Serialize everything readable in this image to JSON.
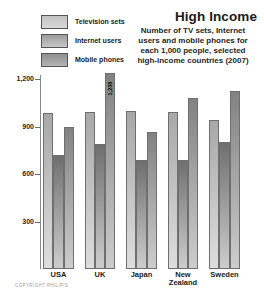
{
  "header": {
    "title": "High Income",
    "subtitle_lines": [
      "Number of TV sets, Internet",
      "users and mobile phones for",
      "each 1,000 people, selected",
      "high-income countries (2007)"
    ]
  },
  "legend": {
    "items": [
      {
        "label": "Television sets",
        "color_top": "#c2c2c2",
        "color_bottom": "#d9d9d9"
      },
      {
        "label": "Internet users",
        "color_top": "#9c9c9c",
        "color_bottom": "#c6c6c6"
      },
      {
        "label": "Mobile phones",
        "color_top": "#8f8f8f",
        "color_bottom": "#b4b4b4"
      }
    ]
  },
  "chart_data": {
    "type": "bar",
    "title": "High Income",
    "subtitle": "Number of TV sets, Internet users and mobile phones for each 1,000 people, selected high-income countries (2007)",
    "categories": [
      "USA",
      "UK",
      "Japan",
      "New Zealand",
      "Sweden"
    ],
    "categories_display": [
      "USA",
      "UK",
      "Japan",
      "New\nZealand",
      "Sweden"
    ],
    "series": [
      {
        "name": "Television sets",
        "values": [
          985,
          990,
          995,
          990,
          940
        ],
        "color_top": "#a8a8a8",
        "color_bottom": "#dedede"
      },
      {
        "name": "Internet users",
        "values": [
          720,
          790,
          690,
          690,
          800
        ],
        "color_top": "#6f6f6f",
        "color_bottom": "#cdcdcd"
      },
      {
        "name": "Mobile phones",
        "values": [
          895,
          1238,
          865,
          1080,
          1125
        ],
        "color_top": "#828282",
        "color_bottom": "#cdcdcd"
      }
    ],
    "ylim": [
      0,
      1200
    ],
    "yticks": [
      300,
      600,
      900,
      1200
    ],
    "ytick_labels": [
      "300",
      "600",
      "900",
      "1,200"
    ],
    "grid": false,
    "legend_position": "top-left",
    "bar_value_labels": [
      {
        "category": "UK",
        "series": "Mobile phones",
        "text": "1,238"
      }
    ]
  },
  "footer": {
    "copyright": "COPYRIGHT PHILIP'S"
  }
}
